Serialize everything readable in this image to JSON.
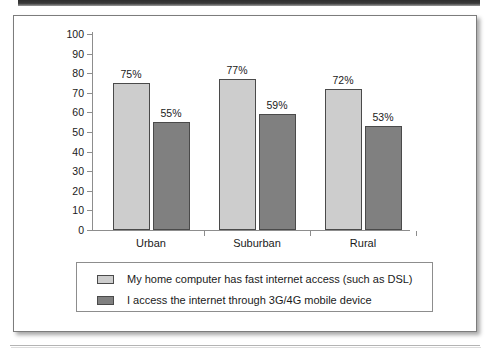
{
  "chart_data": {
    "type": "bar",
    "title": "",
    "xlabel": "",
    "ylabel": "",
    "ylim": [
      0,
      100
    ],
    "ytick_step": 10,
    "grid": false,
    "legend_position": "bottom",
    "categories": [
      "Urban",
      "Suburban",
      "Rural"
    ],
    "yticks": [
      "100",
      "90",
      "80",
      "70",
      "60",
      "50",
      "40",
      "30",
      "20",
      "10",
      "0"
    ],
    "series": [
      {
        "name": "My home computer has fast internet access (such as DSL)",
        "color": "#cdcdcd",
        "values": [
          75,
          77,
          72
        ],
        "labels": [
          "75%",
          "77%",
          "72%"
        ]
      },
      {
        "name": "I access the internet through 3G/4G mobile device",
        "color": "#808080",
        "values": [
          55,
          59,
          53
        ],
        "labels": [
          "55%",
          "59%",
          "53%"
        ]
      }
    ]
  },
  "page": {
    "panel_border_color": "#7c7c7c",
    "axis_color": "#8d8d8d",
    "text_color": "#1a1a1a"
  }
}
